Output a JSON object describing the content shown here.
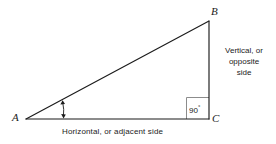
{
  "figure": {
    "type": "right-triangle-diagram",
    "background_color": "#ffffff",
    "line_color": "#1b1b1b",
    "right_angle_box_color": "#8c8c8c",
    "vertices": {
      "a": {
        "label": "A",
        "x": 26,
        "y": 119
      },
      "b": {
        "label": "B",
        "x": 209,
        "y": 21
      },
      "c": {
        "label": "C",
        "x": 209,
        "y": 119
      }
    },
    "labels": {
      "adjacent_side": "Horizontal, or adjacent side",
      "opposite_side_line1": "Vertical, or",
      "opposite_side_line2": "opposite",
      "opposite_side_line3": "side",
      "right_angle_value": "90",
      "degree_symbol": "°"
    },
    "angle_marker": {
      "name": "angle-a-double-arrow",
      "x": 63,
      "top_y": 100,
      "bottom_y": 118
    }
  }
}
